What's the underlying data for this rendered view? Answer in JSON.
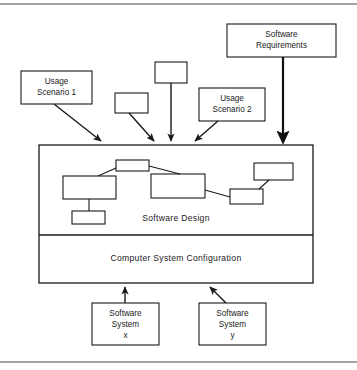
{
  "figure": {
    "background_color": "#ffffff",
    "line_color": "#1a1a1a",
    "rules": {
      "top_rule_y": 4,
      "bottom_rule_y": 362
    }
  },
  "nodes": {
    "software_requirements": {
      "label_line1": "Software",
      "label_line2": "Requirements",
      "x": 227,
      "y": 24,
      "width": 109,
      "height": 33
    },
    "usage_scenario_1": {
      "label_line1": "Usage",
      "label_line2": "Scenario 1",
      "x": 21,
      "y": 71,
      "width": 71,
      "height": 33
    },
    "usage_scenario_2": {
      "label_line1": "Usage",
      "label_line2": "Scenario 2",
      "x": 199,
      "y": 88,
      "width": 66,
      "height": 33
    },
    "unlabeled_top_center": {
      "label_line1": "",
      "x": 155,
      "y": 62,
      "width": 32,
      "height": 21
    },
    "unlabeled_mid_left": {
      "label_line1": "",
      "x": 115,
      "y": 93,
      "width": 33,
      "height": 20
    },
    "software_system_x": {
      "label_line1": "Software",
      "label_line2": "System",
      "label_line3": "x",
      "x": 92,
      "y": 303,
      "width": 67,
      "height": 42
    },
    "software_system_y": {
      "label_line1": "Software",
      "label_line2": "System",
      "label_line3": "y",
      "x": 199,
      "y": 303,
      "width": 67,
      "height": 42
    }
  },
  "container": {
    "x": 39,
    "y": 145,
    "width": 274,
    "height": 138,
    "divider_y": 235,
    "software_design": {
      "label": "Software Design",
      "label_x": 176,
      "label_y": 219
    },
    "computer_system_configuration": {
      "label": "Computer System Configuration",
      "label_x": 176,
      "label_y": 259
    }
  },
  "inner_nodes": [
    {
      "name": "inner-box-top-center",
      "x": 116,
      "y": 160,
      "width": 33,
      "height": 11
    },
    {
      "name": "inner-box-left-large",
      "x": 63,
      "y": 176,
      "width": 53,
      "height": 23
    },
    {
      "name": "inner-box-left-small",
      "x": 72,
      "y": 211,
      "width": 33,
      "height": 13
    },
    {
      "name": "inner-box-center-large",
      "x": 151,
      "y": 174,
      "width": 54,
      "height": 24
    },
    {
      "name": "inner-box-right-upper",
      "x": 254,
      "y": 163,
      "width": 39,
      "height": 17
    },
    {
      "name": "inner-box-right-lower",
      "x": 230,
      "y": 189,
      "width": 33,
      "height": 15
    }
  ],
  "connectors": [
    {
      "name": "connector-top-to-left",
      "x1": 116,
      "y1": 168,
      "x2": 98,
      "y2": 176
    },
    {
      "name": "connector-top-to-center",
      "x1": 149,
      "y1": 166,
      "x2": 180,
      "y2": 174
    },
    {
      "name": "connector-left-to-small",
      "x1": 89,
      "y1": 199,
      "x2": 89,
      "y2": 211
    },
    {
      "name": "connector-center-to-rightlower",
      "x1": 205,
      "y1": 190,
      "x2": 230,
      "y2": 197
    },
    {
      "name": "connector-rightlower-to-rightupper",
      "x1": 258,
      "y1": 189,
      "x2": 268,
      "y2": 180
    }
  ],
  "arrows": [
    {
      "name": "arrow-requirements-to-container",
      "x1": 283,
      "y1": 57,
      "x2": 283,
      "y2": 144,
      "thick": true
    },
    {
      "name": "arrow-scenario1-to-container",
      "x1": 54,
      "y1": 104,
      "x2": 100,
      "y2": 143,
      "thick": false
    },
    {
      "name": "arrow-midleft-to-container",
      "x1": 130,
      "y1": 113,
      "x2": 154,
      "y2": 143,
      "thick": false
    },
    {
      "name": "arrow-topcenter-to-container",
      "x1": 171,
      "y1": 83,
      "x2": 171,
      "y2": 143,
      "thick": false
    },
    {
      "name": "arrow-scenario2-to-container",
      "x1": 217,
      "y1": 121,
      "x2": 194,
      "y2": 143,
      "thick": false
    },
    {
      "name": "arrow-systemx-to-container",
      "x1": 125,
      "y1": 303,
      "x2": 125,
      "y2": 285,
      "thick": false
    },
    {
      "name": "arrow-systemy-to-container",
      "x1": 225,
      "y1": 303,
      "x2": 209,
      "y2": 285,
      "thick": false
    }
  ]
}
